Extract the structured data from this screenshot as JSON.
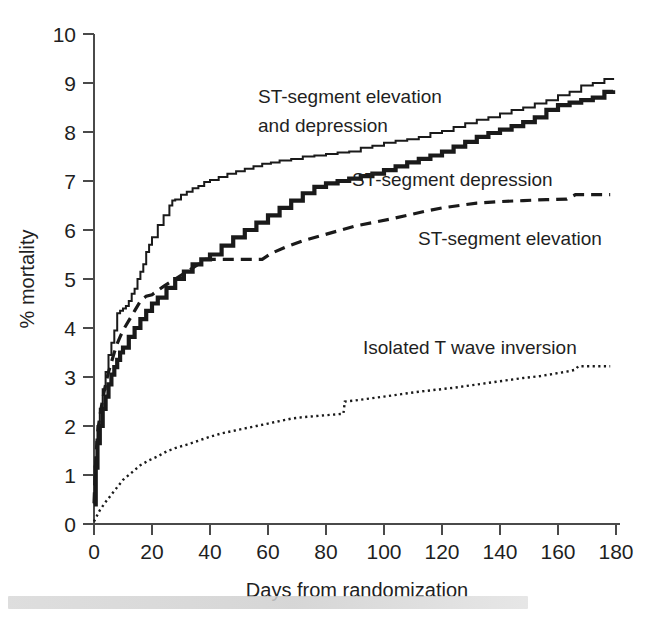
{
  "chart_data": {
    "type": "line",
    "title": "",
    "xlabel": "Days from randomization",
    "ylabel": "% mortality",
    "xlim": [
      0,
      180
    ],
    "ylim": [
      0,
      10
    ],
    "xticks": [
      0,
      20,
      40,
      60,
      80,
      100,
      120,
      140,
      160,
      180
    ],
    "yticks": [
      0,
      1,
      2,
      3,
      4,
      5,
      6,
      7,
      8,
      9,
      10
    ],
    "grid": false,
    "legend_position": "inline-annotations",
    "annotations": [
      {
        "text_lines": [
          "ST-segment elevation",
          "and depression"
        ],
        "x": 52,
        "y": 8.55
      },
      {
        "text_lines": [
          "ST-segment depression"
        ],
        "x": 98,
        "y": 7.15
      },
      {
        "text_lines": [
          "ST-segment elevation"
        ],
        "x": 122,
        "y": 6.05
      },
      {
        "text_lines": [
          "Isolated T wave inversion"
        ],
        "x": 112,
        "y": 3.55
      }
    ],
    "series": [
      {
        "name": "ST-segment elevation and depression",
        "style": "thin-solid",
        "color": "#1a1a1a",
        "x": [
          0,
          0.6,
          1.2,
          2,
          3,
          4,
          5,
          6,
          7,
          8,
          9,
          10,
          11,
          12,
          13,
          14,
          15,
          16,
          17,
          18,
          19,
          20,
          22,
          24,
          26,
          27,
          28,
          30,
          32,
          34,
          36,
          38,
          40,
          43,
          46,
          49,
          52,
          55,
          58,
          61,
          64,
          68,
          72,
          76,
          80,
          84,
          88,
          92,
          96,
          100,
          104,
          108,
          112,
          116,
          120,
          124,
          128,
          132,
          136,
          140,
          144,
          148,
          152,
          156,
          160,
          164,
          168,
          172,
          176,
          179
        ],
        "y": [
          0.45,
          1.35,
          2.0,
          2.35,
          2.75,
          3.1,
          3.45,
          3.7,
          3.95,
          4.3,
          4.35,
          4.4,
          4.45,
          4.55,
          4.7,
          4.8,
          5.0,
          5.15,
          5.3,
          5.55,
          5.7,
          5.85,
          6.1,
          6.3,
          6.5,
          6.6,
          6.62,
          6.72,
          6.78,
          6.85,
          6.9,
          6.98,
          7.02,
          7.08,
          7.15,
          7.2,
          7.25,
          7.3,
          7.35,
          7.38,
          7.42,
          7.45,
          7.5,
          7.52,
          7.55,
          7.58,
          7.6,
          7.68,
          7.72,
          7.78,
          7.82,
          7.85,
          7.9,
          7.98,
          8.02,
          8.1,
          8.18,
          8.25,
          8.3,
          8.38,
          8.45,
          8.5,
          8.58,
          8.65,
          8.75,
          8.82,
          8.95,
          9.0,
          9.08,
          9.1
        ]
      },
      {
        "name": "ST-segment depression",
        "style": "thick-solid",
        "color": "#1a1a1a",
        "x": [
          0,
          0.6,
          1.2,
          2,
          3,
          4,
          5,
          6,
          7,
          8,
          9,
          10,
          12,
          14,
          16,
          18,
          20,
          22,
          25,
          28,
          31,
          34,
          37,
          40,
          44,
          48,
          52,
          56,
          60,
          64,
          68,
          72,
          76,
          80,
          84,
          88,
          92,
          96,
          100,
          104,
          108,
          112,
          116,
          120,
          124,
          128,
          132,
          136,
          140,
          144,
          148,
          152,
          156,
          160,
          164,
          168,
          172,
          176,
          179
        ],
        "y": [
          0.4,
          1.15,
          1.65,
          2.0,
          2.35,
          2.6,
          2.85,
          3.05,
          3.2,
          3.35,
          3.5,
          3.6,
          3.82,
          4.0,
          4.18,
          4.35,
          4.5,
          4.62,
          4.82,
          5.0,
          5.15,
          5.3,
          5.4,
          5.5,
          5.68,
          5.85,
          6.0,
          6.15,
          6.3,
          6.45,
          6.6,
          6.75,
          6.88,
          6.95,
          7.0,
          7.05,
          7.1,
          7.15,
          7.22,
          7.3,
          7.38,
          7.45,
          7.52,
          7.6,
          7.7,
          7.8,
          7.9,
          7.98,
          8.05,
          8.12,
          8.2,
          8.3,
          8.45,
          8.55,
          8.6,
          8.65,
          8.7,
          8.82,
          8.85
        ]
      },
      {
        "name": "ST-segment elevation",
        "style": "dashed",
        "color": "#1a1a1a",
        "x": [
          0,
          0.6,
          1.2,
          2,
          3,
          4,
          5,
          6,
          7,
          8,
          9,
          10,
          12,
          14,
          16,
          18,
          20,
          24,
          28,
          32,
          36,
          38,
          45,
          52,
          58,
          61,
          66,
          72,
          78,
          84,
          90,
          96,
          102,
          108,
          114,
          120,
          126,
          132,
          140,
          148,
          156,
          163,
          166,
          172,
          178
        ],
        "y": [
          0.42,
          1.3,
          1.85,
          2.2,
          2.55,
          2.85,
          3.1,
          3.3,
          3.5,
          3.68,
          3.82,
          3.95,
          4.15,
          4.35,
          4.55,
          4.65,
          4.68,
          4.85,
          5.0,
          5.15,
          5.3,
          5.4,
          5.4,
          5.4,
          5.4,
          5.52,
          5.65,
          5.78,
          5.88,
          5.98,
          6.08,
          6.15,
          6.22,
          6.3,
          6.38,
          6.45,
          6.5,
          6.55,
          6.58,
          6.6,
          6.62,
          6.63,
          6.72,
          6.72,
          6.72
        ]
      },
      {
        "name": "Isolated T wave inversion",
        "style": "dotted",
        "color": "#3a3a3a",
        "x": [
          0,
          2,
          4,
          6,
          8,
          10,
          13,
          16,
          19,
          22,
          25,
          28,
          32,
          36,
          40,
          44,
          48,
          52,
          56,
          60,
          64,
          68,
          72,
          76,
          80,
          84,
          86,
          86.5,
          90,
          95,
          100,
          106,
          112,
          118,
          124,
          130,
          136,
          142,
          148,
          154,
          160,
          164,
          166,
          167,
          172,
          178
        ],
        "y": [
          0.05,
          0.28,
          0.45,
          0.6,
          0.75,
          0.9,
          1.05,
          1.2,
          1.3,
          1.38,
          1.48,
          1.55,
          1.62,
          1.7,
          1.78,
          1.85,
          1.9,
          1.95,
          2.0,
          2.05,
          2.1,
          2.15,
          2.18,
          2.2,
          2.22,
          2.24,
          2.25,
          2.5,
          2.52,
          2.56,
          2.6,
          2.65,
          2.7,
          2.74,
          2.78,
          2.83,
          2.88,
          2.93,
          2.98,
          3.02,
          3.08,
          3.12,
          3.15,
          3.22,
          3.22,
          3.22
        ]
      }
    ]
  },
  "axes": {
    "y_tick_labels": [
      "10",
      "9",
      "8",
      "7",
      "6",
      "5",
      "4",
      "3",
      "2",
      "1",
      "0"
    ],
    "x_tick_labels": [
      "0",
      "20",
      "40",
      "60",
      "80",
      "100",
      "120",
      "140",
      "160",
      "180"
    ],
    "x_axis_title": "Days from randomization",
    "y_axis_title": "% mortality"
  },
  "labels": {
    "series1_line1": "ST-segment elevation",
    "series1_line2": "and depression",
    "series2": "ST-segment depression",
    "series3": "ST-segment elevation",
    "series4": "Isolated T wave inversion"
  },
  "colors": {
    "ink": "#1a1a1a",
    "axis": "#4a4a4a",
    "background": "#ffffff",
    "dotted_series": "#3a3a3a"
  }
}
